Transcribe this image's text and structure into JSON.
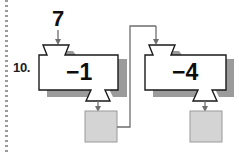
{
  "page": {
    "background_color": "#ffffff",
    "perforation_color": "#9a9a9a"
  },
  "problem": {
    "number_label": "10.",
    "input_value": "7"
  },
  "diagram": {
    "type": "function-machine-chain",
    "machine_outline_color": "#1a1a1a",
    "machine_fill_color": "#ffffff",
    "machine_shadow_color": "#9b9b9b",
    "output_box_fill_color": "#d4d4d4",
    "output_box_border_color": "#9a9a9a",
    "wire_color": "#6e6e6e",
    "machines": [
      {
        "id": "machine-1",
        "operation_label": "−1",
        "operation_text": "minus 1",
        "input_label": "7",
        "output_label": ""
      },
      {
        "id": "machine-2",
        "operation_label": "−4",
        "operation_text": "minus 4",
        "input_label": "",
        "output_label": ""
      }
    ],
    "output_boxes": [
      {
        "id": "output-box-1",
        "value": ""
      },
      {
        "id": "output-box-2",
        "value": ""
      }
    ],
    "connector": {
      "id": "connector-wire",
      "from": "output-box-1",
      "to": "machine-2",
      "description": "wire from first output box right side, up and over, down into second machine hopper"
    }
  }
}
